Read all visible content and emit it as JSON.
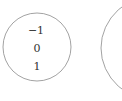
{
  "diagram": {
    "left_set": {
      "elements": [
        "−1",
        "0",
        "1"
      ]
    },
    "right_set": {
      "elements": []
    },
    "colors": {
      "stroke": "#8a8a8a",
      "text": "#333333",
      "background": "#ffffff"
    }
  }
}
